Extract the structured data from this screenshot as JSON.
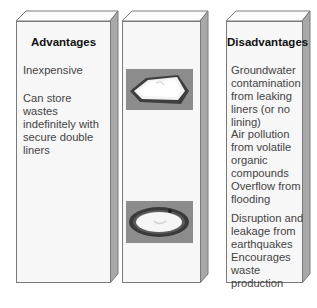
{
  "advantages": {
    "heading": "Advantages",
    "items": [
      "Inexpensive",
      "Can store wastes indefinitely with secure double liners"
    ]
  },
  "middle": {
    "images": [
      {
        "icon": "square-lined-landfill-pit-icon"
      },
      {
        "icon": "round-lined-landfill-pit-icon"
      }
    ]
  },
  "disadvantages": {
    "heading": "Disadvantages",
    "items": [
      "Groundwater contamination from leaking liners (or no lining)",
      "Air pollution from volatile organic compounds",
      "Overflow from flooding",
      "Disruption and leakage from earthquakes",
      "Encourages waste production"
    ]
  },
  "colors": {
    "face": "#f7f7f7",
    "border": "#7a7a7a",
    "side": "#a8a8a8",
    "text": "#444444",
    "heading": "#111111"
  }
}
